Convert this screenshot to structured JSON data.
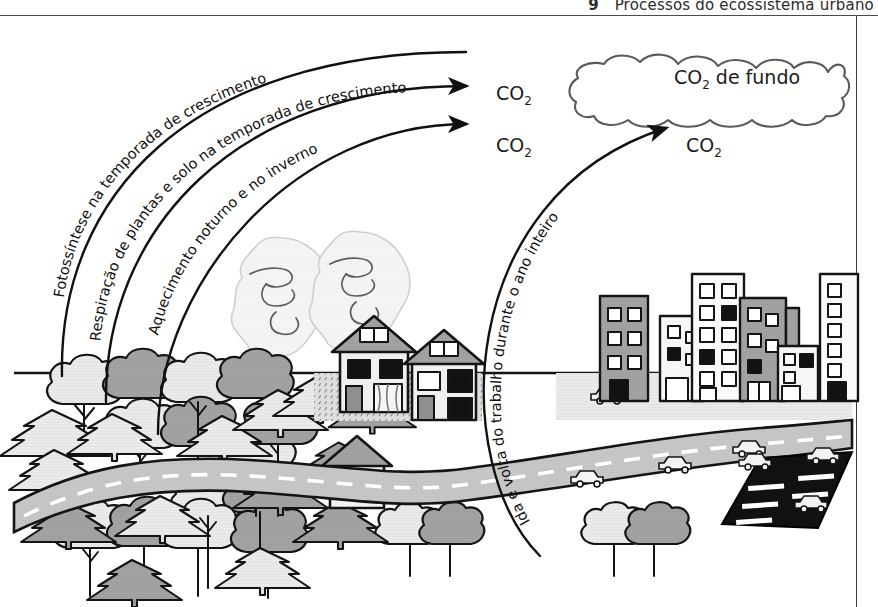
{
  "header": {
    "chapter_number": "9",
    "title": "Processos do ecossistema urbano"
  },
  "figure": {
    "flow_labels": [
      "Fotossíntese na temporada de crescimento",
      "Respiração de plantas e solo na temporada de crescimento",
      "Aquecimento noturno e no inverno",
      "Ida e volta do trabalho durante o ano inteiro"
    ],
    "co2_outputs": [
      {
        "id": "co2-a",
        "text": "CO",
        "sub": "2"
      },
      {
        "id": "co2-b",
        "text": "CO",
        "sub": "2"
      },
      {
        "id": "co2-c",
        "text": "CO",
        "sub": "2"
      }
    ],
    "cloud_label": {
      "text": "CO",
      "sub": "2",
      "suffix": " de fundo"
    },
    "scene_elements": [
      "forest",
      "houses",
      "smoke-plumes",
      "road",
      "cars",
      "city-buildings",
      "parking-lot",
      "ground-line"
    ]
  },
  "colors": {
    "ink": "#1a1a1a",
    "outline": "#141414",
    "light_fill": "#eeeeee",
    "mid_fill": "#c9c9c9",
    "dark_fill": "#9a9a9a",
    "very_dark": "#121212",
    "smoke": "#f2f2f2",
    "road": "#c4c4c4",
    "ground": "#dadada"
  }
}
